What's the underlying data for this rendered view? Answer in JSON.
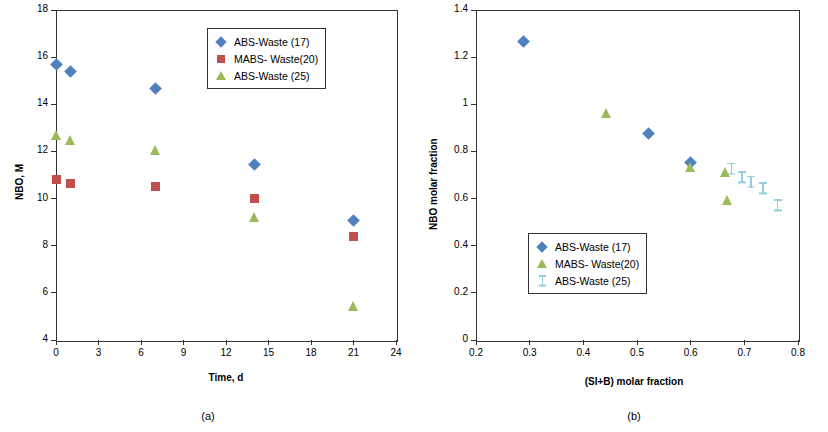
{
  "figure": {
    "panel_a_caption": "(a)",
    "panel_b_caption": "(b)"
  },
  "chart_data": [
    {
      "id": "panel-a",
      "type": "scatter",
      "title": "",
      "xlabel": "Time, d",
      "ylabel": "NBO, M",
      "xlim": [
        0,
        24
      ],
      "ylim": [
        4,
        18
      ],
      "xticks": [
        "0",
        "3",
        "6",
        "9",
        "12",
        "15",
        "18",
        "21",
        "24"
      ],
      "yticks": [
        "4",
        "6",
        "8",
        "10",
        "12",
        "14",
        "16",
        "18"
      ],
      "grid": false,
      "legend_position": "top-center",
      "series": [
        {
          "name": "ABS-Waste (17)",
          "marker": "diamond",
          "color": "#4f81bd",
          "points": [
            [
              0,
              15.7
            ],
            [
              1,
              15.4
            ],
            [
              7,
              14.65
            ],
            [
              14,
              11.45
            ],
            [
              21,
              9.05
            ]
          ]
        },
        {
          "name": "MABS- Waste(20)",
          "marker": "square",
          "color": "#c0504d",
          "points": [
            [
              0,
              10.8
            ],
            [
              1,
              10.65
            ],
            [
              7,
              10.5
            ],
            [
              14,
              10.0
            ],
            [
              21,
              8.4
            ]
          ]
        },
        {
          "name": "ABS-Waste (25)",
          "marker": "triangle",
          "color": "#9bbb59",
          "points": [
            [
              0,
              12.7
            ],
            [
              1,
              12.5
            ],
            [
              7,
              12.05
            ],
            [
              14,
              9.2
            ],
            [
              21,
              5.45
            ]
          ]
        }
      ]
    },
    {
      "id": "panel-b",
      "type": "scatter",
      "title": "",
      "xlabel": "(SI+B) molar fraction",
      "ylabel": "NBO molar fraction",
      "xlim": [
        0.2,
        0.8
      ],
      "ylim": [
        0,
        1.4
      ],
      "xticks": [
        "0.2",
        "0.3",
        "0.4",
        "0.5",
        "0.6",
        "0.7",
        "0.8"
      ],
      "yticks": [
        "0",
        "0.2",
        "0.4",
        "0.6",
        "0.8",
        "1",
        "1.2",
        "1.4"
      ],
      "grid": false,
      "legend_position": "center",
      "series": [
        {
          "name": "ABS-Waste (17)",
          "marker": "diamond",
          "color": "#4f81bd",
          "points": [
            [
              0.288,
              1.265
            ],
            [
              0.521,
              0.878
            ],
            [
              0.6,
              0.752
            ]
          ]
        },
        {
          "name": "MABS- Waste(20)",
          "marker": "triangle",
          "color": "#9bbb59",
          "points": [
            [
              0.443,
              0.962
            ],
            [
              0.6,
              0.735
            ],
            [
              0.665,
              0.712
            ],
            [
              0.668,
              0.596
            ]
          ]
        },
        {
          "name": "ABS-Waste (25)",
          "marker": "i-bar",
          "color": "#92cddc",
          "points": [
            [
              0.676,
              0.727
            ],
            [
              0.696,
              0.69
            ],
            [
              0.712,
              0.672
            ],
            [
              0.735,
              0.645
            ],
            [
              0.762,
              0.572
            ]
          ]
        }
      ]
    }
  ],
  "panel_a_legend": [
    {
      "label": "ABS-Waste (17)",
      "marker": "diamond-icon"
    },
    {
      "label": "MABS- Waste(20)",
      "marker": "square-icon"
    },
    {
      "label": "ABS-Waste (25)",
      "marker": "triangle-icon"
    }
  ],
  "panel_b_legend": [
    {
      "label": "ABS-Waste (17)",
      "marker": "diamond-icon"
    },
    {
      "label": "MABS- Waste(20)",
      "marker": "triangle-icon"
    },
    {
      "label": "ABS-Waste (25)",
      "marker": "i-bar-icon"
    }
  ]
}
